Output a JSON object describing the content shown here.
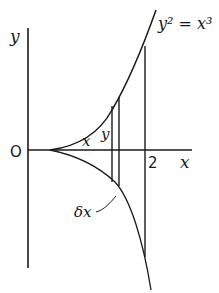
{
  "diagram": {
    "type": "curve-sketch",
    "curve_label": "y² = x³",
    "axes": {
      "x_label": "x",
      "y_label": "y",
      "origin_label": "O",
      "x_tick_label": "2"
    },
    "strip_labels": {
      "x": "x",
      "y": "y",
      "dx": "δx"
    },
    "colors": {
      "ink": "#1a1a1a",
      "background": "#ffffff"
    }
  }
}
